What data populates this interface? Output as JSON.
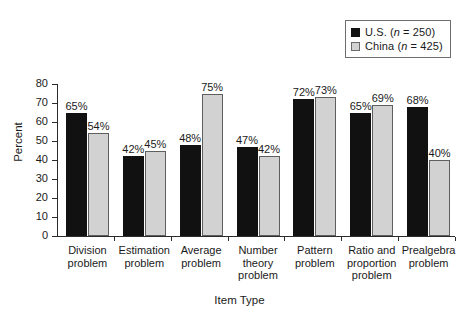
{
  "chart_data": {
    "type": "bar",
    "title": "",
    "xlabel": "Item Type",
    "ylabel": "Percent",
    "ylim": [
      0,
      80
    ],
    "ytick_step": 10,
    "yticks": [
      80,
      70,
      60,
      50,
      40,
      30,
      20,
      10,
      0
    ],
    "grid": false,
    "legend_position": "top-right",
    "value_suffix": "%",
    "categories": [
      "Division problem",
      "Estimation problem",
      "Average problem",
      "Number theory problem",
      "Pattern problem",
      "Ratio and proportion problem",
      "Prealgebra problem"
    ],
    "category_lines": [
      [
        "Division",
        "problem"
      ],
      [
        "Estimation",
        "problem"
      ],
      [
        "Average",
        "problem"
      ],
      [
        "Number",
        "theory",
        "problem"
      ],
      [
        "Pattern",
        "problem"
      ],
      [
        "Ratio and",
        "proportion",
        "problem"
      ],
      [
        "Prealgebra",
        "problem"
      ]
    ],
    "series": [
      {
        "name": "U.S.",
        "legend_label": "U.S. (n = 250)",
        "legend_prefix": "U.S. (",
        "legend_italic": "n",
        "legend_suffix": " = 250)",
        "n": 250,
        "color": "#111111",
        "values": [
          65,
          42,
          48,
          47,
          72,
          65,
          68
        ],
        "value_labels": [
          "65%",
          "42%",
          "48%",
          "47%",
          "72%",
          "65%",
          "68%"
        ]
      },
      {
        "name": "China",
        "legend_label": "China (n = 425)",
        "legend_prefix": "China (",
        "legend_italic": "n",
        "legend_suffix": " = 425)",
        "n": 425,
        "color": "#d2d2d2",
        "values": [
          54,
          45,
          75,
          42,
          73,
          69,
          40
        ],
        "value_labels": [
          "54%",
          "45%",
          "75%",
          "42%",
          "73%",
          "69%",
          "40%"
        ]
      }
    ]
  },
  "axes": {
    "y_title": "Percent",
    "x_title": "Item Type",
    "y_tick_labels": [
      "80",
      "70",
      "60",
      "50",
      "40",
      "30",
      "20",
      "10",
      "0"
    ]
  },
  "legend": {
    "items": [
      {
        "swatch": "black-square-icon",
        "label": "U.S. (n = 250)"
      },
      {
        "swatch": "gray-square-icon",
        "label": "China (n = 425)"
      }
    ]
  }
}
